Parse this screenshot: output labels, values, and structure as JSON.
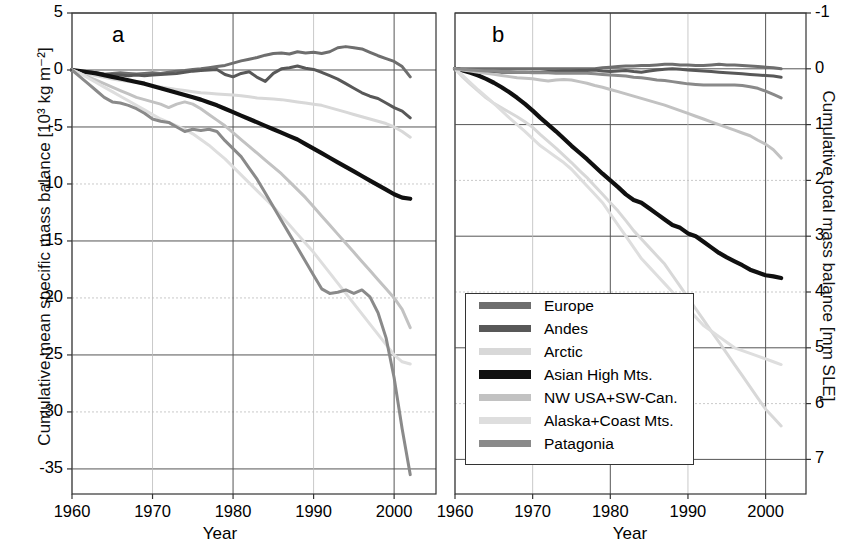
{
  "figure": {
    "xlabel": "Year",
    "panel_a_letter": "a",
    "panel_b_letter": "b",
    "left_axis_title": "Cumulative mean specific mass balance [10³ kg m⁻²]",
    "right_axis_title": "Cumulative total mass balance [mm SLE]",
    "x_ticks": [
      "1960",
      "1970",
      "1980",
      "1990",
      "2000"
    ],
    "left_y_ticks": [
      "5",
      "0",
      "-5",
      "-10",
      "-15",
      "-20",
      "-25",
      "-30",
      "-35"
    ],
    "right_y_ticks": [
      "-1",
      "0",
      "1",
      "2",
      "3",
      "4",
      "5",
      "6",
      "7"
    ]
  },
  "legend": {
    "items": [
      {
        "label": "Europe",
        "color": "#6e6e6e"
      },
      {
        "label": "Andes",
        "color": "#585858"
      },
      {
        "label": "Arctic",
        "color": "#d8d8d8"
      },
      {
        "label": "Asian High Mts.",
        "color": "#101010"
      },
      {
        "label": "NW USA+SW-Can.",
        "color": "#c2c2c2"
      },
      {
        "label": "Alaska+Coast Mts.",
        "color": "#dedede"
      },
      {
        "label": "Patagonia",
        "color": "#8a8a8a"
      }
    ]
  },
  "chart_data": [
    {
      "type": "line",
      "panel": "a",
      "title": "",
      "xlabel": "Year",
      "ylabel": "Cumulative mean specific mass balance [10³ kg m⁻²]",
      "xlim": [
        1960,
        2005
      ],
      "ylim": [
        -37,
        5
      ],
      "grid": true,
      "x": [
        1960,
        1961,
        1962,
        1963,
        1964,
        1965,
        1966,
        1967,
        1968,
        1969,
        1970,
        1971,
        1972,
        1973,
        1974,
        1975,
        1976,
        1977,
        1978,
        1979,
        1980,
        1981,
        1982,
        1983,
        1984,
        1985,
        1986,
        1987,
        1988,
        1989,
        1990,
        1991,
        1992,
        1993,
        1994,
        1995,
        1996,
        1997,
        1998,
        1999,
        2000,
        2001,
        2002
      ],
      "series": [
        {
          "name": "Europe",
          "color": "#6e6e6e",
          "values": [
            0,
            -0.1,
            -0.2,
            -0.3,
            -0.4,
            -0.3,
            -0.25,
            -0.3,
            -0.35,
            -0.3,
            -0.25,
            -0.3,
            -0.2,
            -0.1,
            -0.05,
            0.05,
            0.1,
            0.2,
            0.3,
            0.4,
            0.6,
            0.8,
            0.95,
            1.1,
            1.3,
            1.45,
            1.5,
            1.4,
            1.6,
            1.5,
            1.55,
            1.45,
            1.6,
            1.95,
            2.05,
            1.95,
            1.85,
            1.55,
            1.25,
            1.0,
            0.75,
            0.3,
            -0.6
          ]
        },
        {
          "name": "Andes",
          "color": "#585858",
          "values": [
            0,
            -0.1,
            -0.15,
            -0.25,
            -0.35,
            -0.4,
            -0.45,
            -0.5,
            -0.45,
            -0.5,
            -0.45,
            -0.4,
            -0.35,
            -0.3,
            -0.2,
            -0.1,
            -0.05,
            0.0,
            0.05,
            -0.4,
            -0.6,
            -0.3,
            -0.15,
            -0.65,
            -1.0,
            -0.3,
            0.1,
            0.2,
            0.35,
            0.15,
            0.05,
            -0.2,
            -0.5,
            -0.8,
            -1.2,
            -1.6,
            -2.0,
            -2.3,
            -2.5,
            -2.9,
            -3.3,
            -3.6,
            -4.2
          ]
        },
        {
          "name": "Arctic",
          "color": "#d8d8d8",
          "values": [
            0,
            -0.2,
            -0.35,
            -0.5,
            -0.65,
            -0.8,
            -0.9,
            -1.0,
            -1.1,
            -1.2,
            -1.35,
            -1.5,
            -1.6,
            -1.7,
            -1.8,
            -1.9,
            -2.0,
            -2.05,
            -2.1,
            -2.15,
            -2.2,
            -2.25,
            -2.35,
            -2.45,
            -2.5,
            -2.55,
            -2.6,
            -2.7,
            -2.8,
            -2.9,
            -3.0,
            -3.1,
            -3.3,
            -3.5,
            -3.7,
            -3.9,
            -4.1,
            -4.3,
            -4.5,
            -4.7,
            -5.0,
            -5.4,
            -5.9
          ]
        },
        {
          "name": "Asian High Mts.",
          "color": "#101010",
          "values": [
            0,
            -0.1,
            -0.2,
            -0.3,
            -0.45,
            -0.6,
            -0.75,
            -0.9,
            -1.05,
            -1.2,
            -1.4,
            -1.6,
            -1.8,
            -2.0,
            -2.2,
            -2.4,
            -2.6,
            -2.85,
            -3.1,
            -3.4,
            -3.7,
            -4.0,
            -4.3,
            -4.6,
            -4.9,
            -5.2,
            -5.5,
            -5.8,
            -6.1,
            -6.5,
            -6.9,
            -7.3,
            -7.7,
            -8.1,
            -8.5,
            -8.9,
            -9.3,
            -9.7,
            -10.1,
            -10.5,
            -10.9,
            -11.2,
            -11.3
          ]
        },
        {
          "name": "NW USA+SW-Can.",
          "color": "#c2c2c2",
          "values": [
            0,
            -0.3,
            -0.6,
            -0.9,
            -1.2,
            -1.5,
            -1.8,
            -2.1,
            -2.4,
            -2.6,
            -2.8,
            -3.0,
            -3.3,
            -3.0,
            -2.8,
            -3.0,
            -3.4,
            -3.9,
            -4.4,
            -4.9,
            -5.5,
            -6.1,
            -6.7,
            -7.3,
            -7.9,
            -8.5,
            -9.1,
            -9.8,
            -10.5,
            -11.2,
            -12.0,
            -12.8,
            -13.6,
            -14.4,
            -15.2,
            -16.0,
            -16.8,
            -17.6,
            -18.4,
            -19.2,
            -20.0,
            -21.0,
            -22.6
          ]
        },
        {
          "name": "Alaska+Coast Mts.",
          "color": "#dedede",
          "values": [
            0,
            -0.3,
            -0.7,
            -1.1,
            -1.5,
            -1.9,
            -2.3,
            -2.7,
            -3.1,
            -3.5,
            -3.9,
            -4.3,
            -4.6,
            -4.9,
            -5.2,
            -5.6,
            -6.1,
            -6.6,
            -7.2,
            -7.8,
            -8.5,
            -9.2,
            -9.9,
            -10.6,
            -11.3,
            -12.0,
            -12.8,
            -13.6,
            -14.4,
            -15.2,
            -16.0,
            -16.9,
            -17.8,
            -18.7,
            -19.6,
            -20.5,
            -21.4,
            -22.3,
            -23.2,
            -24.1,
            -25.0,
            -25.6,
            -25.8
          ]
        },
        {
          "name": "Patagonia",
          "color": "#8a8a8a",
          "values": [
            0,
            -0.6,
            -1.2,
            -1.8,
            -2.4,
            -2.8,
            -2.9,
            -3.1,
            -3.4,
            -3.8,
            -4.3,
            -4.5,
            -4.6,
            -5.0,
            -5.4,
            -5.2,
            -5.3,
            -5.2,
            -5.4,
            -6.2,
            -6.9,
            -7.6,
            -8.6,
            -9.6,
            -10.8,
            -12.0,
            -13.2,
            -14.4,
            -15.6,
            -16.8,
            -18.0,
            -19.2,
            -19.6,
            -19.5,
            -19.3,
            -19.6,
            -19.3,
            -19.9,
            -21.3,
            -23.5,
            -27.0,
            -31.5,
            -35.5
          ]
        }
      ]
    },
    {
      "type": "line",
      "panel": "b",
      "title": "",
      "xlabel": "Year",
      "ylabel": "Cumulative total mass balance [mm SLE]",
      "xlim": [
        1960,
        2005
      ],
      "ylim": [
        -1,
        7.6
      ],
      "y_inverted": true,
      "grid": true,
      "x": [
        1960,
        1961,
        1962,
        1963,
        1964,
        1965,
        1966,
        1967,
        1968,
        1969,
        1970,
        1971,
        1972,
        1973,
        1974,
        1975,
        1976,
        1977,
        1978,
        1979,
        1980,
        1981,
        1982,
        1983,
        1984,
        1985,
        1986,
        1987,
        1988,
        1989,
        1990,
        1991,
        1992,
        1993,
        1994,
        1995,
        1996,
        1997,
        1998,
        1999,
        2000,
        2001,
        2002
      ],
      "series": [
        {
          "name": "Europe",
          "color": "#6e6e6e",
          "values": [
            0,
            0,
            0,
            0,
            0,
            0,
            0,
            0,
            0,
            0,
            0,
            0,
            0,
            0,
            0,
            0,
            0,
            0,
            0,
            -0.02,
            -0.03,
            -0.04,
            -0.05,
            -0.05,
            -0.06,
            -0.06,
            -0.07,
            -0.08,
            -0.08,
            -0.07,
            -0.07,
            -0.06,
            -0.06,
            -0.07,
            -0.08,
            -0.07,
            -0.07,
            -0.06,
            -0.05,
            -0.04,
            -0.03,
            -0.02,
            0.0
          ]
        },
        {
          "name": "Andes",
          "color": "#585858",
          "values": [
            0,
            0.02,
            0.03,
            0.04,
            0.05,
            0.05,
            0.06,
            0.06,
            0.06,
            0.06,
            0.06,
            0.06,
            0.05,
            0.05,
            0.04,
            0.04,
            0.03,
            0.03,
            0.02,
            0.04,
            0.05,
            0.04,
            0.03,
            0.05,
            0.06,
            0.04,
            0.02,
            0.01,
            0.0,
            0.01,
            0.02,
            0.03,
            0.04,
            0.05,
            0.06,
            0.07,
            0.08,
            0.09,
            0.1,
            0.11,
            0.12,
            0.13,
            0.15
          ]
        },
        {
          "name": "Arctic",
          "color": "#d8d8d8",
          "values": [
            0,
            0.15,
            0.28,
            0.4,
            0.52,
            0.62,
            0.7,
            0.78,
            0.86,
            0.95,
            1.05,
            1.18,
            1.3,
            1.42,
            1.55,
            1.68,
            1.82,
            1.95,
            2.1,
            2.25,
            2.4,
            2.55,
            2.72,
            2.9,
            3.05,
            3.2,
            3.35,
            3.5,
            3.7,
            3.9,
            4.1,
            4.3,
            4.5,
            4.7,
            4.9,
            5.1,
            5.3,
            5.5,
            5.7,
            5.9,
            6.1,
            6.25,
            6.4
          ]
        },
        {
          "name": "Asian High Mts.",
          "color": "#101010",
          "values": [
            0,
            0.03,
            0.07,
            0.12,
            0.18,
            0.25,
            0.33,
            0.42,
            0.52,
            0.63,
            0.75,
            0.88,
            1.0,
            1.12,
            1.25,
            1.38,
            1.5,
            1.62,
            1.75,
            1.88,
            2.0,
            2.12,
            2.25,
            2.35,
            2.4,
            2.5,
            2.6,
            2.7,
            2.8,
            2.85,
            2.95,
            3.0,
            3.1,
            3.2,
            3.3,
            3.38,
            3.45,
            3.52,
            3.6,
            3.65,
            3.7,
            3.72,
            3.75
          ]
        },
        {
          "name": "NW USA+SW-Can.",
          "color": "#c2c2c2",
          "values": [
            0,
            0.02,
            0.04,
            0.06,
            0.08,
            0.1,
            0.12,
            0.14,
            0.16,
            0.17,
            0.18,
            0.2,
            0.22,
            0.2,
            0.19,
            0.2,
            0.23,
            0.26,
            0.3,
            0.33,
            0.37,
            0.41,
            0.45,
            0.49,
            0.53,
            0.57,
            0.61,
            0.65,
            0.7,
            0.75,
            0.8,
            0.85,
            0.9,
            0.95,
            1.0,
            1.05,
            1.1,
            1.15,
            1.2,
            1.28,
            1.35,
            1.45,
            1.6
          ]
        },
        {
          "name": "Alaska+Coast Mts.",
          "color": "#dedede",
          "values": [
            0,
            0.12,
            0.25,
            0.38,
            0.5,
            0.62,
            0.75,
            0.88,
            1.0,
            1.12,
            1.25,
            1.38,
            1.48,
            1.58,
            1.68,
            1.8,
            1.95,
            2.1,
            2.25,
            2.4,
            2.6,
            2.8,
            3.0,
            3.2,
            3.4,
            3.55,
            3.7,
            3.85,
            4.0,
            4.15,
            4.3,
            4.45,
            4.6,
            4.7,
            4.8,
            4.9,
            5.0,
            5.05,
            5.1,
            5.15,
            5.2,
            5.25,
            5.3
          ]
        },
        {
          "name": "Patagonia",
          "color": "#8a8a8a",
          "values": [
            0,
            0.01,
            0.02,
            0.03,
            0.04,
            0.04,
            0.05,
            0.05,
            0.06,
            0.06,
            0.07,
            0.07,
            0.07,
            0.08,
            0.08,
            0.08,
            0.08,
            0.08,
            0.09,
            0.1,
            0.11,
            0.12,
            0.13,
            0.15,
            0.16,
            0.18,
            0.2,
            0.21,
            0.23,
            0.25,
            0.27,
            0.28,
            0.29,
            0.29,
            0.29,
            0.29,
            0.29,
            0.3,
            0.32,
            0.35,
            0.4,
            0.46,
            0.52
          ]
        }
      ]
    }
  ]
}
